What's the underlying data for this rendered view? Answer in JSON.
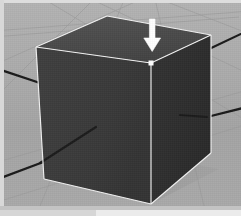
{
  "app": {
    "title": "3D Viewport",
    "viewport_label": "perspective-viewport"
  },
  "scene": {
    "background_color": "#a9a9a9",
    "grid_color": "#9a9a9a",
    "axis_color": "#1a1a1a",
    "object_name": "Cube",
    "object_edge_color": "#f2f2f2",
    "faces": [
      {
        "name": "top-face",
        "color": "#4b4b4b"
      },
      {
        "name": "front-left-face",
        "color": "#3b3b3b"
      },
      {
        "name": "right-face",
        "color": "#2f2f2f"
      }
    ],
    "vertices": {
      "top_back": [
        103,
        13
      ],
      "top_left": [
        32,
        44
      ],
      "top_right": [
        207,
        32
      ],
      "top_front": [
        147,
        60
      ],
      "bottom_left": [
        40,
        176
      ],
      "bottom_front": [
        147,
        201
      ],
      "bottom_right": [
        207,
        150
      ]
    },
    "selected_vertex": "top_front"
  },
  "gizmo": {
    "name": "move-down-arrow",
    "color": "#ffffff",
    "direction": "down",
    "position": [
      148,
      28
    ],
    "tooltip": "Move down"
  },
  "axes": [
    {
      "name": "axis-x",
      "from": [
        0,
        69
      ],
      "to": [
        147,
        117
      ]
    },
    {
      "name": "axis-x-right",
      "from": [
        147,
        117
      ],
      "to": [
        237,
        104
      ]
    },
    {
      "name": "axis-y",
      "from": [
        0,
        176
      ],
      "to": [
        147,
        118
      ]
    },
    {
      "name": "axis-y-back",
      "from": [
        147,
        118
      ],
      "to": [
        237,
        57
      ]
    }
  ],
  "footer": {
    "panel_label": "status-strip"
  }
}
